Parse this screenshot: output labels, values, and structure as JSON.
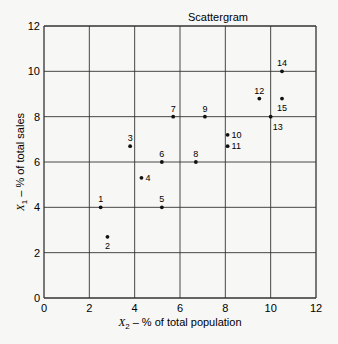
{
  "chart_data": {
    "type": "scatter",
    "title": "Scattergram",
    "xlabel": "X2 – % of total population",
    "ylabel": "X1 – % of total sales",
    "xlim": [
      0,
      12
    ],
    "ylim": [
      0,
      12
    ],
    "xticks": [
      0,
      2,
      4,
      6,
      8,
      10,
      12
    ],
    "yticks": [
      0,
      2,
      4,
      6,
      8,
      10,
      12
    ],
    "grid": true,
    "legend": null,
    "points": [
      {
        "label": "1",
        "x": 2.5,
        "y": 4.0
      },
      {
        "label": "2",
        "x": 2.8,
        "y": 2.7
      },
      {
        "label": "3",
        "x": 3.8,
        "y": 6.7
      },
      {
        "label": "4",
        "x": 4.3,
        "y": 5.3
      },
      {
        "label": "5",
        "x": 5.2,
        "y": 4.0
      },
      {
        "label": "6",
        "x": 5.2,
        "y": 6.0
      },
      {
        "label": "7",
        "x": 5.7,
        "y": 8.0
      },
      {
        "label": "8",
        "x": 6.7,
        "y": 6.0
      },
      {
        "label": "9",
        "x": 7.1,
        "y": 8.0
      },
      {
        "label": "10",
        "x": 8.1,
        "y": 7.2
      },
      {
        "label": "11",
        "x": 8.1,
        "y": 6.7
      },
      {
        "label": "12",
        "x": 9.5,
        "y": 8.8
      },
      {
        "label": "13",
        "x": 10.0,
        "y": 8.0
      },
      {
        "label": "14",
        "x": 10.5,
        "y": 10.0
      },
      {
        "label": "15",
        "x": 10.5,
        "y": 8.8
      }
    ]
  },
  "label_positions": {
    "1": "above",
    "2": "below",
    "3": "above",
    "4": "right",
    "5": "above",
    "6": "above",
    "7": "above",
    "8": "above",
    "9": "above",
    "10": "right",
    "11": "right",
    "12": "above",
    "13": "below-right",
    "14": "above",
    "15": "below"
  }
}
